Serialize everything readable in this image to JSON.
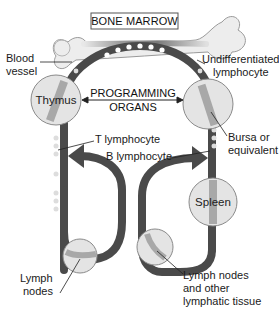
{
  "title_box": {
    "label": "BONE MARROW"
  },
  "labels": {
    "blood_vessel_line1": "Blood",
    "blood_vessel_line2": "vessel",
    "undiff_line1": "Undifferentiated",
    "undiff_line2": "lymphocyte",
    "programming_line1": "PROGRAMMING",
    "programming_line2": "ORGANS",
    "t_lymphocyte": "T lymphocyte",
    "b_lymphocyte": "B lymphocyte",
    "bursa_line1": "Bursa or",
    "bursa_line2": "equivalent",
    "lymph_nodes_line1": "Lymph",
    "lymph_nodes_line2": "nodes",
    "lymph_other_line1": "Lymph nodes",
    "lymph_other_line2": "and other",
    "lymph_other_line3": "lymphatic tissue"
  },
  "organs": {
    "thymus": "Thymus",
    "bursa": "",
    "spleen": "Spleen",
    "lymph_left": "",
    "lymph_right": ""
  },
  "cell_glyphs": {
    "t_cell": "T",
    "b_cell": "B"
  },
  "colors": {
    "vessel": "#4a4a4a",
    "organ_fill": "#e3e3e3",
    "organ_stroke": "#8a8a8a",
    "organ_stripe": "#a8a8a8",
    "bone": "#ececec",
    "bone_stroke": "#9a9a9a",
    "arrow": "#505050",
    "text": "#1a1a1a"
  }
}
